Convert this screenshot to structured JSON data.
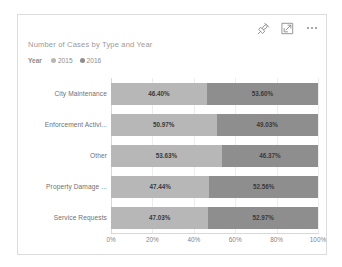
{
  "card": {
    "title": "Number of Cases by Type and Year",
    "actions": [
      {
        "name": "pin-icon",
        "label": "Pin to dashboard"
      },
      {
        "name": "focus-mode-icon",
        "label": "Focus mode"
      },
      {
        "name": "more-options-icon",
        "label": "More options"
      }
    ]
  },
  "legend": {
    "title": "Year",
    "items": [
      {
        "label": "2015",
        "color": "#b7b7b7"
      },
      {
        "label": "2016",
        "color": "#8e8e8e"
      }
    ]
  },
  "colors": {
    "series_2015": "#b7b7b7",
    "series_2016": "#8e8e8e",
    "axis": "#d8d8d8",
    "gridline": "#ededed",
    "card_border": "#dcdcdc",
    "title_text": "#9a9a9a",
    "label_text": "#707070",
    "value_text": "#3a3a3a"
  },
  "chart_data": {
    "type": "bar",
    "orientation": "horizontal",
    "stacked": true,
    "stack_mode": "percent",
    "title": "Number of Cases by Type and Year",
    "xlabel": "",
    "ylabel": "",
    "xlim": [
      0,
      100
    ],
    "xticks": [
      "0%",
      "20%",
      "40%",
      "60%",
      "80%",
      "100%"
    ],
    "xtick_values": [
      0,
      20,
      40,
      60,
      80,
      100
    ],
    "grid": true,
    "legend_position": "top-left",
    "categories": [
      "City Maintenance",
      "Enforcement Activi...",
      "Other",
      "Property Damage ...",
      "Service Requests"
    ],
    "series": [
      {
        "name": "2015",
        "color": "#b7b7b7",
        "values": [
          46.4,
          50.97,
          53.63,
          47.44,
          47.03
        ],
        "labels": [
          "46.40%",
          "50.97%",
          "53.63%",
          "47.44%",
          "47.03%"
        ]
      },
      {
        "name": "2016",
        "color": "#8e8e8e",
        "values": [
          53.6,
          49.03,
          46.37,
          52.56,
          52.97
        ],
        "labels": [
          "53.60%",
          "49.03%",
          "46.37%",
          "52.56%",
          "52.97%"
        ]
      }
    ]
  }
}
